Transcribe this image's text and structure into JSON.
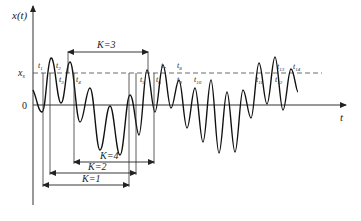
{
  "figure": {
    "y_axis_label": "x(t)",
    "x_axis_label": "t",
    "origin_label": "0",
    "threshold_label": "x",
    "threshold_subscript": "s",
    "crossing_labels": [
      {
        "name": "t",
        "sub": "1"
      },
      {
        "name": "t",
        "sub": "2"
      },
      {
        "name": "t",
        "sub": "3"
      },
      {
        "name": "t",
        "sub": "4"
      },
      {
        "name": "t",
        "sub": "5"
      },
      {
        "name": "t",
        "sub": "6"
      },
      {
        "name": "t",
        "sub": "7"
      },
      {
        "name": "t",
        "sub": "8"
      },
      {
        "name": "t",
        "sub": "9"
      },
      {
        "name": "t",
        "sub": "10"
      },
      {
        "name": "t",
        "sub": "11"
      },
      {
        "name": "t",
        "sub": "12"
      },
      {
        "name": "t",
        "sub": "13"
      },
      {
        "name": "t",
        "sub": "14"
      }
    ],
    "intervals": [
      {
        "label": "K=3"
      },
      {
        "label": "K=4"
      },
      {
        "label": "K=2"
      },
      {
        "label": "K=1"
      }
    ]
  }
}
